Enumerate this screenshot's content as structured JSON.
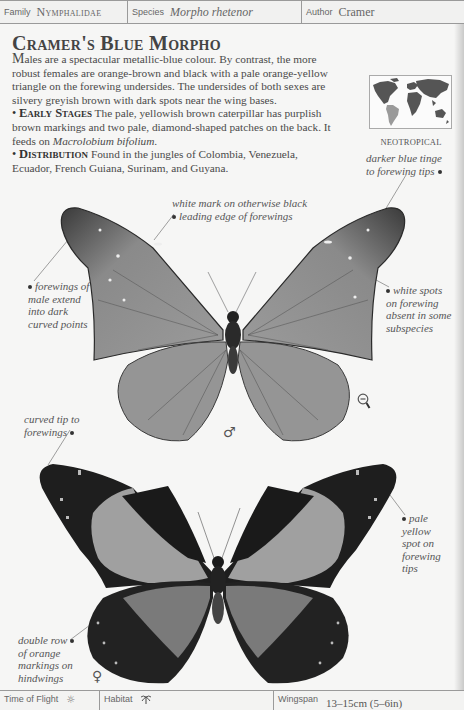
{
  "header": {
    "family_label": "Family",
    "family_value": "Nymphalidae",
    "species_label": "Species",
    "species_value": "Morpho rhetenor",
    "author_label": "Author",
    "author_value": "Cramer"
  },
  "title": "Cramer's Blue Morpho",
  "description": {
    "intro_lead": "M",
    "intro_rest": "ales are a spectacular metallic-blue colour. By contrast, the more robust females are orange-brown and black with a pale orange-yellow triangle on the forewing undersides. The undersides of both sexes are silvery greyish brown with dark spots near the wing bases.",
    "early_stages_heading": "Early Stages",
    "early_stages_text": "The pale, yellowish brown caterpillar has purplish brown markings and two pale, diamond-shaped patches on the back. It feeds on",
    "early_stages_plant": "Macrolobium bifolium",
    "early_stages_end": ".",
    "distribution_heading": "Distribution",
    "distribution_text": "Found in the jungles of Colombia, Venezuela, Ecuador, French Guiana, Surinam, and Guyana."
  },
  "map": {
    "region_label": "Neotropical",
    "highlight_color": "#9a9a9a",
    "land_color": "#555555"
  },
  "annotations": {
    "darker_tips": "darker blue tinge to forewing tips",
    "white_mark": "white mark on otherwise black leading edge of forewings",
    "white_mark_line1": "white mark on otherwise black",
    "white_mark_line2": "leading edge of forewings",
    "forewings_male": [
      "forewings of",
      "male extend",
      "into dark",
      "curved points"
    ],
    "white_spots": [
      "white spots",
      "on forewing",
      "absent in some",
      "subspecies"
    ],
    "curved_tip": [
      "curved tip to",
      "forewings"
    ],
    "pale_yellow": [
      "pale",
      "yellow",
      "spot on",
      "forewing",
      "tips"
    ],
    "double_row": [
      "double row",
      "of orange",
      "markings on",
      "hindwings"
    ],
    "darker_tips_lines": [
      "darker blue tinge",
      "to forewing tips"
    ]
  },
  "specimens": {
    "male_symbol": "♂",
    "female_symbol": "♀",
    "scale_icon": "magnifier-minus-icon"
  },
  "footer": {
    "time_of_flight_label": "Time of Flight",
    "time_of_flight_icon": "☼",
    "habitat_label": "Habitat",
    "habitat_icon": "palm-tree-icon",
    "wingspan_label": "Wingspan",
    "wingspan_value": "13–15cm (5–6in)"
  }
}
